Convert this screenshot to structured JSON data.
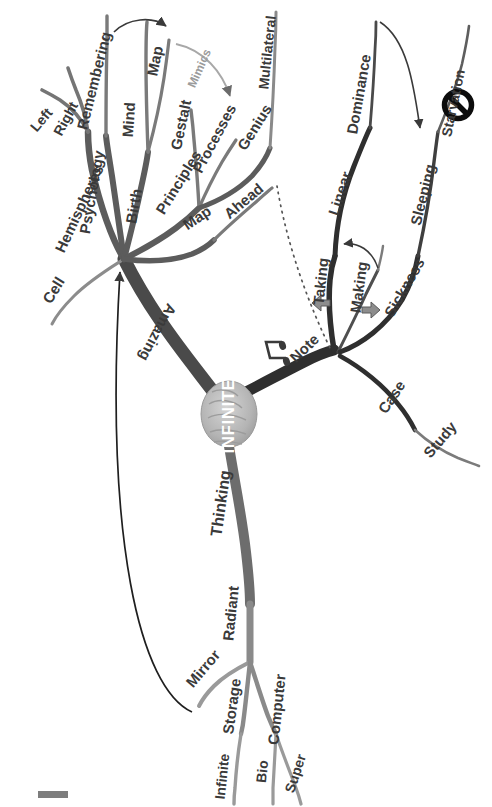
{
  "diagram": {
    "title": "INFINITE",
    "center_label": "INFINITE",
    "orientation": "rotated-90",
    "colors": {
      "branch_dark": "#3d3d3d",
      "branch_mid": "#6b6b6b",
      "branch_light": "#a0a0a0",
      "text": "#3a3a3a",
      "text_muted": "#9b9b9b",
      "background": "#ffffff",
      "brain": "#b9b9b9",
      "corner_marker": "#7d7d7d"
    },
    "icons": {
      "brain": "brain-icon",
      "note": "music-note-icon",
      "prohibition": "no-entry-icon",
      "arrow_up": "arrow-up-icon",
      "arrow_down": "arrow-down-icon"
    },
    "branches": {
      "amazing": {
        "label": "Amazing",
        "children": [
          {
            "label": "Hemispheres",
            "children": [
              {
                "label": "Left"
              },
              {
                "label": "Right"
              }
            ]
          },
          {
            "label": "Cell"
          },
          {
            "label": "Psychology",
            "children": [
              {
                "label": "Remembering"
              }
            ]
          },
          {
            "label": "Birth",
            "children": [
              {
                "label": "Mind"
              },
              {
                "label": "Map"
              }
            ]
          },
          {
            "label": "Principles",
            "children": [
              {
                "label": "Gestalt"
              },
              {
                "label": "Processes"
              },
              {
                "label": "Genius",
                "children": [
                  {
                    "label": "Multilateral"
                  }
                ]
              }
            ]
          },
          {
            "label": "Map",
            "children": [
              {
                "label": "Ahead"
              }
            ]
          }
        ]
      },
      "note": {
        "label": "Note",
        "children": [
          {
            "label": "Taking"
          },
          {
            "label": "Making"
          },
          {
            "label": "Linear",
            "children": [
              {
                "label": "Dominance"
              }
            ]
          },
          {
            "label": "Sickness",
            "children": [
              {
                "label": "Sleeping",
                "children": [
                  {
                    "label": "Starvation"
                  }
                ]
              }
            ]
          },
          {
            "label": "Case",
            "children": [
              {
                "label": "Study"
              }
            ]
          }
        ]
      },
      "thinking": {
        "label": "Thinking",
        "children": [
          {
            "label": "Radiant",
            "children": [
              {
                "label": "Mirror"
              },
              {
                "label": "Storage",
                "children": [
                  {
                    "label": "Infinite"
                  }
                ]
              },
              {
                "label": "Computer",
                "children": [
                  {
                    "label": "Bio"
                  },
                  {
                    "label": "Super"
                  }
                ]
              }
            ]
          }
        ]
      }
    },
    "annotations": [
      {
        "label": "Mimics",
        "type": "curved-arrow-label",
        "from": "Map",
        "to": "Processes"
      }
    ],
    "connectors": [
      {
        "type": "solid-arrow",
        "from": "Remembering",
        "to": "Map"
      },
      {
        "type": "curved-arrow",
        "from": "Mimics",
        "to": "Processes"
      },
      {
        "type": "thin-arrow",
        "from": "Mirror",
        "to": "Amazing-hub"
      },
      {
        "type": "dotted-line",
        "from": "Ahead",
        "to": "Note-hub"
      },
      {
        "type": "thin-arrow",
        "from": "Making",
        "to": "Taking"
      },
      {
        "type": "thin-arrow",
        "from": "Dominance",
        "to": "Sleeping"
      }
    ]
  }
}
